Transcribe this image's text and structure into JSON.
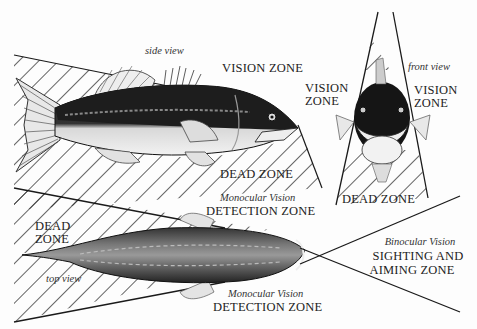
{
  "diagram": {
    "colors": {
      "ink": "#1a1a1a",
      "background": "#fdfdfd",
      "hatch": "#222222"
    },
    "views": {
      "side": {
        "caption": "side view",
        "vision_zone": "VISION ZONE",
        "dead_zone": "DEAD ZONE"
      },
      "front": {
        "caption": "front view",
        "vision_zone_left_1": "VISION",
        "vision_zone_left_2": "ZONE",
        "vision_zone_right_1": "VISION",
        "vision_zone_right_2": "ZONE",
        "dead_zone": "DEAD ZONE"
      },
      "top": {
        "caption": "top view",
        "dead_zone_1": "DEAD",
        "dead_zone_2": "ZONE",
        "monocular_upper_sub": "Monocular Vision",
        "monocular_upper_main": "DETECTION ZONE",
        "monocular_lower_sub": "Monocular Vision",
        "monocular_lower_main": "DETECTION ZONE",
        "binocular_sub": "Binocular Vision",
        "binocular_main_1": "SIGHTING AND",
        "binocular_main_2": "AIMING ZONE"
      }
    }
  }
}
